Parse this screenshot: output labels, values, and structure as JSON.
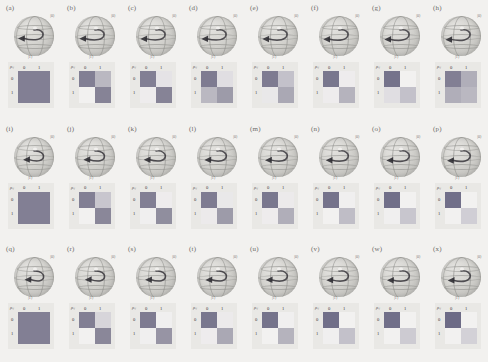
{
  "figure": {
    "type": "grid-of-panels",
    "rows": 3,
    "columns": 8,
    "panel_count": 24,
    "background_color": "#f2f1ef",
    "matrix_symbol": "ρᵢⱼ",
    "matrix_row_labels": [
      "0",
      "1"
    ],
    "matrix_col_labels": [
      "0",
      "1"
    ],
    "bloch_axis_top_label": "|0⟩",
    "bloch_axis_bottom_label": "|1⟩",
    "colorscale": {
      "dark": "#6d6b86",
      "mid_dark": "#8a8799",
      "mid": "#a8a6b2",
      "light": "#cfcdd4",
      "lightest": "#f7f6f4",
      "panel_bg": "#e9e8e5"
    }
  },
  "panels": [
    {
      "label": "(a)",
      "arrow": {
        "azimuth": -8,
        "length": 0.92
      },
      "matrix": {
        "merged": true,
        "merged_value": 0.5,
        "cells": [
          [
            0.5,
            0.5
          ],
          [
            0.5,
            0.5
          ]
        ]
      }
    },
    {
      "label": "(b)",
      "arrow": {
        "azimuth": -6,
        "length": 0.9
      },
      "matrix": {
        "merged": false,
        "cells": [
          [
            0.5,
            0.3
          ],
          [
            0.02,
            0.48
          ]
        ]
      }
    },
    {
      "label": "(c)",
      "arrow": {
        "azimuth": -4,
        "length": 0.9
      },
      "matrix": {
        "merged": false,
        "cells": [
          [
            0.5,
            0.08
          ],
          [
            0.04,
            0.48
          ]
        ]
      }
    },
    {
      "label": "(d)",
      "arrow": {
        "azimuth": -3,
        "length": 0.9
      },
      "matrix": {
        "merged": false,
        "cells": [
          [
            0.52,
            0.1
          ],
          [
            0.3,
            0.4
          ]
        ]
      }
    },
    {
      "label": "(e)",
      "arrow": {
        "azimuth": -2,
        "length": 0.9
      },
      "matrix": {
        "merged": false,
        "cells": [
          [
            0.52,
            0.26
          ],
          [
            0.06,
            0.36
          ]
        ]
      }
    },
    {
      "label": "(f)",
      "arrow": {
        "azimuth": 0,
        "length": 0.9
      },
      "matrix": {
        "merged": false,
        "cells": [
          [
            0.54,
            0.04
          ],
          [
            0.04,
            0.32
          ]
        ]
      }
    },
    {
      "label": "(g)",
      "arrow": {
        "azimuth": 2,
        "length": 0.9
      },
      "matrix": {
        "merged": false,
        "cells": [
          [
            0.56,
            0.02
          ],
          [
            0.1,
            0.26
          ]
        ]
      }
    },
    {
      "label": "(h)",
      "arrow": {
        "azimuth": 4,
        "length": 0.9
      },
      "matrix": {
        "merged": false,
        "cells": [
          [
            0.5,
            0.34
          ],
          [
            0.34,
            0.3
          ]
        ]
      }
    },
    {
      "label": "(i)",
      "arrow": {
        "azimuth": -10,
        "length": 0.62
      },
      "matrix": {
        "merged": true,
        "merged_value": 0.5,
        "cells": [
          [
            0.5,
            0.5
          ],
          [
            0.5,
            0.5
          ]
        ]
      }
    },
    {
      "label": "(j)",
      "arrow": {
        "azimuth": -8,
        "length": 0.66
      },
      "matrix": {
        "merged": false,
        "cells": [
          [
            0.5,
            0.24
          ],
          [
            0.02,
            0.46
          ]
        ]
      }
    },
    {
      "label": "(k)",
      "arrow": {
        "azimuth": -6,
        "length": 0.7
      },
      "matrix": {
        "merged": false,
        "cells": [
          [
            0.5,
            0.04
          ],
          [
            0.03,
            0.44
          ]
        ]
      }
    },
    {
      "label": "(l)",
      "arrow": {
        "azimuth": -4,
        "length": 0.72
      },
      "matrix": {
        "merged": false,
        "cells": [
          [
            0.52,
            0.06
          ],
          [
            0.05,
            0.4
          ]
        ]
      }
    },
    {
      "label": "(m)",
      "arrow": {
        "azimuth": -2,
        "length": 0.74
      },
      "matrix": {
        "merged": false,
        "cells": [
          [
            0.54,
            0.05
          ],
          [
            0.04,
            0.34
          ]
        ]
      }
    },
    {
      "label": "(n)",
      "arrow": {
        "azimuth": 0,
        "length": 0.76
      },
      "matrix": {
        "merged": false,
        "cells": [
          [
            0.56,
            0.03
          ],
          [
            0.02,
            0.28
          ]
        ]
      }
    },
    {
      "label": "(o)",
      "arrow": {
        "azimuth": 2,
        "length": 0.78
      },
      "matrix": {
        "merged": false,
        "cells": [
          [
            0.58,
            0.02
          ],
          [
            0.03,
            0.24
          ]
        ]
      }
    },
    {
      "label": "(p)",
      "arrow": {
        "azimuth": 4,
        "length": 0.8
      },
      "matrix": {
        "merged": false,
        "cells": [
          [
            0.58,
            0.02
          ],
          [
            0.02,
            0.2
          ]
        ]
      }
    },
    {
      "label": "(q)",
      "arrow": {
        "azimuth": -12,
        "length": 0.54
      },
      "matrix": {
        "merged": true,
        "merged_value": 0.5,
        "cells": [
          [
            0.5,
            0.5
          ],
          [
            0.5,
            0.5
          ]
        ]
      }
    },
    {
      "label": "(r)",
      "arrow": {
        "azimuth": -10,
        "length": 0.58
      },
      "matrix": {
        "merged": false,
        "cells": [
          [
            0.5,
            0.16
          ],
          [
            0.02,
            0.46
          ]
        ]
      }
    },
    {
      "label": "(s)",
      "arrow": {
        "azimuth": -8,
        "length": 0.62
      },
      "matrix": {
        "merged": false,
        "cells": [
          [
            0.52,
            0.03
          ],
          [
            0.03,
            0.42
          ]
        ]
      }
    },
    {
      "label": "(t)",
      "arrow": {
        "azimuth": -6,
        "length": 0.66
      },
      "matrix": {
        "merged": false,
        "cells": [
          [
            0.54,
            0.05
          ],
          [
            0.04,
            0.36
          ]
        ]
      }
    },
    {
      "label": "(u)",
      "arrow": {
        "azimuth": -4,
        "length": 0.7
      },
      "matrix": {
        "merged": false,
        "cells": [
          [
            0.56,
            0.03
          ],
          [
            0.02,
            0.32
          ]
        ]
      }
    },
    {
      "label": "(v)",
      "arrow": {
        "azimuth": -2,
        "length": 0.72
      },
      "matrix": {
        "merged": false,
        "cells": [
          [
            0.58,
            0.02
          ],
          [
            0.03,
            0.26
          ]
        ]
      }
    },
    {
      "label": "(w)",
      "arrow": {
        "azimuth": 0,
        "length": 0.74
      },
      "matrix": {
        "merged": false,
        "cells": [
          [
            0.58,
            0.02
          ],
          [
            0.02,
            0.22
          ]
        ]
      }
    },
    {
      "label": "(x)",
      "arrow": {
        "azimuth": 2,
        "length": 0.76
      },
      "matrix": {
        "merged": false,
        "cells": [
          [
            0.6,
            0.02
          ],
          [
            0.02,
            0.18
          ]
        ]
      }
    }
  ]
}
